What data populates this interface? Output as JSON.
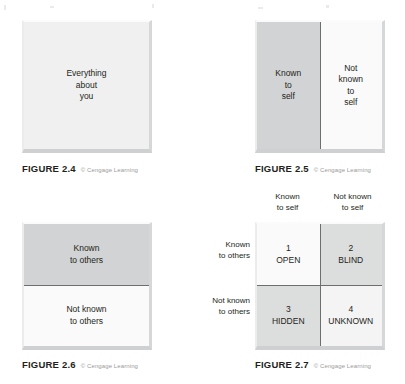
{
  "figures": [
    {
      "id": "figure-2-4",
      "caption_title": "FIGURE 2.4",
      "caption_credit": "© Cengage Learning",
      "panels": [
        {
          "name": "everything-about-you",
          "lines": [
            "Everything",
            "about",
            "you"
          ]
        }
      ]
    },
    {
      "id": "figure-2-5",
      "caption_title": "FIGURE 2.5",
      "caption_credit": "© Cengage Learning",
      "panels": [
        {
          "name": "known-to-self",
          "lines": [
            "Known",
            "to",
            "self"
          ]
        },
        {
          "name": "not-known-to-self",
          "lines": [
            "Not",
            "known",
            "to",
            "self"
          ]
        }
      ]
    },
    {
      "id": "figure-2-6",
      "caption_title": "FIGURE 2.6",
      "caption_credit": "© Cengage Learning",
      "panels": [
        {
          "name": "known-to-others",
          "lines": [
            "Known",
            "to others"
          ]
        },
        {
          "name": "not-known-to-others",
          "lines": [
            "Not known",
            "to others"
          ]
        }
      ]
    },
    {
      "id": "figure-2-7",
      "caption_title": "FIGURE 2.7",
      "caption_credit": "© Cengage Learning",
      "column_headers": [
        {
          "name": "known-to-self",
          "lines": [
            "Known",
            "to self"
          ]
        },
        {
          "name": "not-known-to-self",
          "lines": [
            "Not known",
            "to self"
          ]
        }
      ],
      "row_headers": [
        {
          "name": "known-to-others",
          "lines": [
            "Known",
            "to others"
          ]
        },
        {
          "name": "not-known-to-others",
          "lines": [
            "Not known",
            "to others"
          ]
        }
      ],
      "quadrants": [
        {
          "name": "open",
          "number": "1",
          "label": "OPEN"
        },
        {
          "name": "blind",
          "number": "2",
          "label": "BLIND"
        },
        {
          "name": "hidden",
          "number": "3",
          "label": "HIDDEN"
        },
        {
          "name": "unknown",
          "number": "4",
          "label": "UNKNOWN"
        }
      ]
    }
  ],
  "colors": {
    "ink": "#231f20",
    "credit": "#9a9a9a",
    "divider": "#6d6e70",
    "tone_light": "#f4f4f4",
    "tone_lighter": "#fafafa",
    "tone_mid": "#d2d3d4",
    "tone_midlow": "#dcdddd",
    "page": "#ffffff"
  }
}
